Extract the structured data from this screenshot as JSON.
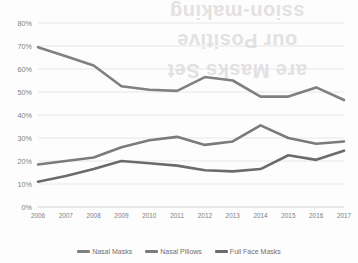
{
  "chart_data": {
    "type": "line",
    "title": "",
    "xlabel": "",
    "ylabel": "",
    "categories": [
      "2006",
      "2007",
      "2008",
      "2009",
      "2010",
      "2011",
      "2012",
      "2013",
      "2014",
      "2015",
      "2016",
      "2017"
    ],
    "ylim": [
      0,
      80
    ],
    "ytick_labels": [
      "0%",
      "10%",
      "20%",
      "30%",
      "40%",
      "50%",
      "60%",
      "70%",
      "80%"
    ],
    "ytick_values": [
      0,
      10,
      20,
      30,
      40,
      50,
      60,
      70,
      80
    ],
    "grid": true,
    "legend_position": "bottom",
    "series": [
      {
        "name": "Nasal Masks",
        "color": "#808080",
        "values": [
          69.5,
          65.5,
          61.5,
          52.5,
          51.0,
          50.5,
          56.5,
          55.0,
          48.0,
          48.0,
          52.0,
          46.5
        ]
      },
      {
        "name": "Nasal Pillows",
        "color": "#7b7b7b",
        "values": [
          18.5,
          20.0,
          21.5,
          26.0,
          29.0,
          30.5,
          27.0,
          28.5,
          35.5,
          30.0,
          27.5,
          28.5
        ]
      },
      {
        "name": "Full Face Masks",
        "color": "#6b6b6b",
        "values": [
          11.0,
          13.5,
          16.5,
          20.0,
          19.0,
          18.0,
          16.0,
          15.5,
          16.5,
          22.5,
          20.5,
          24.5
        ]
      }
    ]
  },
  "bleed_text": {
    "line1": "ssion-making",
    "line2": "our Positive",
    "line3": "are Masks Set"
  }
}
